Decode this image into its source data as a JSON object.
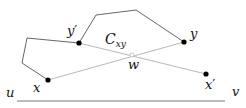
{
  "diagram": {
    "colors": {
      "dark_line": "#555555",
      "light_line": "#b8b8b8",
      "point": "#000000",
      "baseline": "#777777"
    },
    "labels": {
      "x": "x",
      "y": "y",
      "y_prime_base": "y",
      "y_prime_mark": "′",
      "x_prime_base": "x",
      "x_prime_mark": "′",
      "w": "w",
      "c_base": "C",
      "c_sub": "xy",
      "u": "u",
      "v": "v"
    },
    "points": {
      "x": [
        48,
        80
      ],
      "y_prime": [
        79,
        43
      ],
      "y": [
        184,
        42
      ],
      "x_prime": [
        206,
        74
      ],
      "w": [
        132,
        55
      ]
    },
    "dark_path": [
      [
        48,
        80
      ],
      [
        22,
        63
      ],
      [
        27,
        38
      ],
      [
        79,
        43
      ],
      [
        96,
        15
      ],
      [
        136,
        10
      ],
      [
        184,
        42
      ]
    ],
    "light_segments": [
      [
        [
          48,
          80
        ],
        [
          184,
          42
        ]
      ],
      [
        [
          79,
          43
        ],
        [
          206,
          74
        ]
      ]
    ],
    "baseline": [
      [
        17,
        101
      ],
      [
        225,
        101
      ]
    ]
  }
}
